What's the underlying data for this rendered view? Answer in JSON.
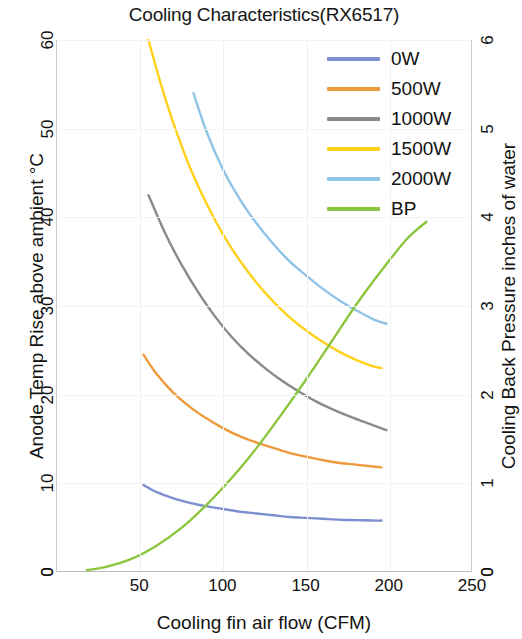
{
  "chart_data": {
    "type": "line",
    "title": "Cooling Characteristics(RX6517)",
    "xlabel": "Cooling fin air flow (CFM)",
    "ylabel": "Anode Temp Rise above ambient °C",
    "y2label": "Cooling Back Pressure inches of water",
    "xlim": [
      0,
      250
    ],
    "ylim": [
      0,
      60
    ],
    "y2lim": [
      0,
      6
    ],
    "xticks": [
      0,
      50,
      100,
      150,
      200,
      250
    ],
    "xtick_labels": [
      "0",
      "50",
      "100",
      "150",
      "200",
      "250"
    ],
    "yticks": [
      0,
      10,
      20,
      30,
      40,
      50,
      60
    ],
    "ytick_labels": [
      "0",
      "10",
      "20",
      "30",
      "40",
      "50",
      "60"
    ],
    "y2ticks": [
      0,
      1,
      2,
      3,
      4,
      5,
      6
    ],
    "y2tick_labels": [
      "0",
      "1",
      "2",
      "3",
      "4",
      "5",
      "6"
    ],
    "grid": true,
    "legend_position": "upper right",
    "series": [
      {
        "name": "0W",
        "color": "#7d8fd1",
        "axis": "left",
        "points": [
          [
            52,
            9.8
          ],
          [
            60,
            9.0
          ],
          [
            70,
            8.3
          ],
          [
            80,
            7.8
          ],
          [
            90,
            7.4
          ],
          [
            100,
            7.1
          ],
          [
            110,
            6.8
          ],
          [
            120,
            6.6
          ],
          [
            130,
            6.4
          ],
          [
            140,
            6.2
          ],
          [
            150,
            6.1
          ],
          [
            160,
            6.0
          ],
          [
            170,
            5.9
          ],
          [
            180,
            5.85
          ],
          [
            190,
            5.8
          ],
          [
            195,
            5.8
          ]
        ]
      },
      {
        "name": "500W",
        "color": "#ee9a3c",
        "axis": "left",
        "points": [
          [
            52,
            24.5
          ],
          [
            60,
            22.3
          ],
          [
            70,
            20.2
          ],
          [
            80,
            18.6
          ],
          [
            90,
            17.3
          ],
          [
            100,
            16.2
          ],
          [
            110,
            15.3
          ],
          [
            120,
            14.6
          ],
          [
            130,
            14.0
          ],
          [
            140,
            13.4
          ],
          [
            150,
            13.0
          ],
          [
            160,
            12.6
          ],
          [
            170,
            12.3
          ],
          [
            180,
            12.1
          ],
          [
            190,
            11.9
          ],
          [
            195,
            11.8
          ]
        ]
      },
      {
        "name": "1000W",
        "color": "#8a8a8a",
        "axis": "left",
        "points": [
          [
            55,
            42.5
          ],
          [
            65,
            38.2
          ],
          [
            75,
            34.6
          ],
          [
            85,
            31.5
          ],
          [
            95,
            28.8
          ],
          [
            105,
            26.5
          ],
          [
            115,
            24.6
          ],
          [
            125,
            23.0
          ],
          [
            135,
            21.6
          ],
          [
            145,
            20.4
          ],
          [
            155,
            19.3
          ],
          [
            165,
            18.4
          ],
          [
            175,
            17.6
          ],
          [
            185,
            16.9
          ],
          [
            195,
            16.2
          ],
          [
            198,
            16.0
          ]
        ]
      },
      {
        "name": "1500W",
        "color": "#ffd11a",
        "axis": "left",
        "points": [
          [
            55,
            60.0
          ],
          [
            62,
            55.3
          ],
          [
            70,
            50.6
          ],
          [
            80,
            45.6
          ],
          [
            90,
            41.5
          ],
          [
            100,
            38.0
          ],
          [
            110,
            35.1
          ],
          [
            120,
            32.6
          ],
          [
            130,
            30.5
          ],
          [
            140,
            28.7
          ],
          [
            150,
            27.2
          ],
          [
            160,
            25.9
          ],
          [
            170,
            24.8
          ],
          [
            180,
            23.9
          ],
          [
            190,
            23.2
          ],
          [
            195,
            23.0
          ]
        ]
      },
      {
        "name": "2000W",
        "color": "#8fc4e8",
        "axis": "left",
        "points": [
          [
            82,
            54.0
          ],
          [
            90,
            49.6
          ],
          [
            100,
            45.3
          ],
          [
            110,
            42.0
          ],
          [
            120,
            39.3
          ],
          [
            130,
            37.0
          ],
          [
            140,
            35.0
          ],
          [
            150,
            33.4
          ],
          [
            160,
            31.9
          ],
          [
            170,
            30.6
          ],
          [
            180,
            29.5
          ],
          [
            190,
            28.5
          ],
          [
            198,
            28.0
          ]
        ]
      },
      {
        "name": "BP",
        "color": "#8cc63e",
        "axis": "right",
        "points": [
          [
            18,
            0.02
          ],
          [
            30,
            0.06
          ],
          [
            45,
            0.15
          ],
          [
            60,
            0.3
          ],
          [
            75,
            0.5
          ],
          [
            90,
            0.76
          ],
          [
            105,
            1.06
          ],
          [
            120,
            1.4
          ],
          [
            135,
            1.78
          ],
          [
            150,
            2.18
          ],
          [
            165,
            2.6
          ],
          [
            180,
            3.02
          ],
          [
            195,
            3.4
          ],
          [
            210,
            3.75
          ],
          [
            222,
            3.95
          ]
        ]
      }
    ]
  },
  "legend": {
    "items": [
      {
        "label": "0W",
        "color": "#7d8fd1"
      },
      {
        "label": "500W",
        "color": "#ee9a3c"
      },
      {
        "label": "1000W",
        "color": "#8a8a8a"
      },
      {
        "label": "1500W",
        "color": "#ffd11a"
      },
      {
        "label": "2000W",
        "color": "#8fc4e8"
      },
      {
        "label": "BP",
        "color": "#8cc63e"
      }
    ]
  }
}
